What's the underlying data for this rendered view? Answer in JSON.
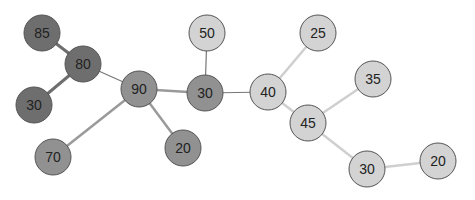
{
  "graph": {
    "colors": {
      "dark": "#6e6e6e",
      "medium": "#919191",
      "light": "#d3d3d3",
      "edge_dark": "#6e6e6e",
      "edge_medium": "#9a9a9a",
      "edge_light": "#cfcfcf",
      "edge_connector": "#777777"
    },
    "radius": 18,
    "nodes": [
      {
        "id": "n1",
        "label": "85",
        "x": 42,
        "y": 33,
        "group": "dark"
      },
      {
        "id": "n2",
        "label": "80",
        "x": 83,
        "y": 64,
        "group": "dark"
      },
      {
        "id": "n3",
        "label": "30",
        "x": 34,
        "y": 105,
        "group": "dark"
      },
      {
        "id": "n4",
        "label": "90",
        "x": 139,
        "y": 89,
        "group": "medium"
      },
      {
        "id": "n5",
        "label": "70",
        "x": 53,
        "y": 157,
        "group": "medium"
      },
      {
        "id": "n6",
        "label": "20",
        "x": 183,
        "y": 148,
        "group": "medium"
      },
      {
        "id": "n7",
        "label": "50",
        "x": 207,
        "y": 33,
        "group": "light"
      },
      {
        "id": "n8",
        "label": "30",
        "x": 205,
        "y": 93,
        "group": "medium"
      },
      {
        "id": "n9",
        "label": "40",
        "x": 268,
        "y": 92,
        "group": "light"
      },
      {
        "id": "n10",
        "label": "25",
        "x": 318,
        "y": 33,
        "group": "light"
      },
      {
        "id": "n11",
        "label": "35",
        "x": 373,
        "y": 79,
        "group": "light"
      },
      {
        "id": "n12",
        "label": "45",
        "x": 308,
        "y": 123,
        "group": "light"
      },
      {
        "id": "n13",
        "label": "30",
        "x": 367,
        "y": 169,
        "group": "light"
      },
      {
        "id": "n14",
        "label": "20",
        "x": 438,
        "y": 161,
        "group": "light"
      }
    ],
    "edges": [
      {
        "from": "n1",
        "to": "n2",
        "style": "edge_dark",
        "width": 3
      },
      {
        "from": "n2",
        "to": "n3",
        "style": "edge_dark",
        "width": 3
      },
      {
        "from": "n2",
        "to": "n4",
        "style": "edge_connector",
        "width": 1.2
      },
      {
        "from": "n4",
        "to": "n5",
        "style": "edge_medium",
        "width": 2.5
      },
      {
        "from": "n4",
        "to": "n6",
        "style": "edge_medium",
        "width": 2.5
      },
      {
        "from": "n4",
        "to": "n8",
        "style": "edge_medium",
        "width": 2.5
      },
      {
        "from": "n7",
        "to": "n8",
        "style": "edge_connector",
        "width": 1.2
      },
      {
        "from": "n8",
        "to": "n9",
        "style": "edge_connector",
        "width": 1.2
      },
      {
        "from": "n9",
        "to": "n10",
        "style": "edge_light",
        "width": 2.5
      },
      {
        "from": "n9",
        "to": "n12",
        "style": "edge_light",
        "width": 2.5
      },
      {
        "from": "n11",
        "to": "n12",
        "style": "edge_light",
        "width": 2.5
      },
      {
        "from": "n12",
        "to": "n13",
        "style": "edge_light",
        "width": 2.5
      },
      {
        "from": "n13",
        "to": "n14",
        "style": "edge_light",
        "width": 2.5
      }
    ]
  }
}
